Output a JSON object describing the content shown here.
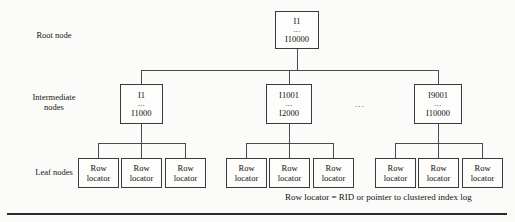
{
  "diagram": {
    "row_labels": {
      "root": "Root node",
      "intermediate": "Intermediate\nnodes",
      "leaf": "Leaf nodes"
    },
    "root_node": {
      "first": "I1",
      "ellipsis": "...",
      "last": "I10000"
    },
    "intermediate_nodes": [
      {
        "first": "I1",
        "ellipsis": "...",
        "last": "I1000"
      },
      {
        "first": "I1001",
        "ellipsis": "...",
        "last": "I2000"
      },
      {
        "first": "I9001",
        "ellipsis": "...",
        "last": "I10000"
      }
    ],
    "gap_ellipsis": "...",
    "leaf_nodes": [
      {
        "line1": "Row",
        "line2": "locator"
      },
      {
        "line1": "Row",
        "line2": "locator"
      },
      {
        "line1": "Row",
        "line2": "locator"
      },
      {
        "line1": "Row",
        "line2": "locator"
      },
      {
        "line1": "Row",
        "line2": "locator"
      },
      {
        "line1": "Row",
        "line2": "locator"
      },
      {
        "line1": "Row",
        "line2": "locator"
      },
      {
        "line1": "Row",
        "line2": "locator"
      },
      {
        "line1": "Row",
        "line2": "locator"
      }
    ],
    "caption": "Row locator = RID or pointer to clustered index log",
    "colors": {
      "line": "#4a4a4a",
      "box_border": "#3a3a3a",
      "text": "#111111",
      "rule": "#2b2b2b",
      "page_background": "#fbfbfa"
    }
  }
}
